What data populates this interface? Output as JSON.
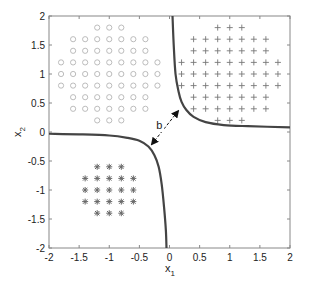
{
  "chart_data": {
    "type": "scatter",
    "title": "",
    "xlabel": "x",
    "xlabel_sub": "1",
    "ylabel": "x",
    "ylabel_sub": "2",
    "xlim": [
      -2,
      2
    ],
    "ylim": [
      -2,
      2
    ],
    "xticks": [
      -2,
      -1.5,
      -1,
      -0.5,
      0,
      0.5,
      1,
      1.5,
      2
    ],
    "yticks": [
      -2,
      -1.5,
      -1,
      -0.5,
      0,
      0.5,
      1,
      1.5,
      2
    ],
    "xtick_labels": [
      "-2",
      "-1.5",
      "-1",
      "-0.5",
      "0",
      "0.5",
      "1",
      "1.5",
      "2"
    ],
    "ytick_labels": [
      "-2",
      "-1.5",
      "-1",
      "-0.5",
      "0",
      "0.5",
      "1",
      "1.5",
      "2"
    ],
    "grid": false,
    "legend": null,
    "series": [
      {
        "name": "class-circle",
        "marker": "o",
        "color": "#b4b4b4",
        "center": [
          -1,
          1
        ],
        "rows": [
          {
            "y": 1.8,
            "x": [
              -1.2,
              -1.0,
              -0.8
            ]
          },
          {
            "y": 1.6,
            "x": [
              -1.6,
              -1.4,
              -1.2,
              -1.0,
              -0.8,
              -0.6,
              -0.4
            ]
          },
          {
            "y": 1.4,
            "x": [
              -1.6,
              -1.4,
              -1.2,
              -1.0,
              -0.8,
              -0.6,
              -0.4
            ]
          },
          {
            "y": 1.2,
            "x": [
              -1.8,
              -1.6,
              -1.4,
              -1.2,
              -1.0,
              -0.8,
              -0.6,
              -0.4,
              -0.2
            ]
          },
          {
            "y": 1.0,
            "x": [
              -1.8,
              -1.6,
              -1.4,
              -1.2,
              -1.0,
              -0.8,
              -0.6,
              -0.4,
              -0.2
            ]
          },
          {
            "y": 0.8,
            "x": [
              -1.8,
              -1.6,
              -1.4,
              -1.2,
              -1.0,
              -0.8,
              -0.6,
              -0.4,
              -0.2
            ]
          },
          {
            "y": 0.6,
            "x": [
              -1.6,
              -1.4,
              -1.2,
              -1.0,
              -0.8,
              -0.6,
              -0.4
            ]
          },
          {
            "y": 0.4,
            "x": [
              -1.6,
              -1.4,
              -1.2,
              -1.0,
              -0.8,
              -0.6,
              -0.4
            ]
          },
          {
            "y": 0.2,
            "x": [
              -1.2,
              -1.0,
              -0.8
            ]
          }
        ]
      },
      {
        "name": "class-plus",
        "marker": "+",
        "color": "#777777",
        "center": [
          1,
          1
        ],
        "rows": [
          {
            "y": 1.8,
            "x": [
              0.8,
              1.0,
              1.2
            ]
          },
          {
            "y": 1.6,
            "x": [
              0.4,
              0.6,
              0.8,
              1.0,
              1.2,
              1.4,
              1.6
            ]
          },
          {
            "y": 1.4,
            "x": [
              0.4,
              0.6,
              0.8,
              1.0,
              1.2,
              1.4,
              1.6
            ]
          },
          {
            "y": 1.2,
            "x": [
              0.2,
              0.4,
              0.6,
              0.8,
              1.0,
              1.2,
              1.4,
              1.6,
              1.8
            ]
          },
          {
            "y": 1.0,
            "x": [
              0.2,
              0.4,
              0.6,
              0.8,
              1.0,
              1.2,
              1.4,
              1.6,
              1.8
            ]
          },
          {
            "y": 0.8,
            "x": [
              0.2,
              0.4,
              0.6,
              0.8,
              1.0,
              1.2,
              1.4,
              1.6,
              1.8
            ]
          },
          {
            "y": 0.6,
            "x": [
              0.4,
              0.6,
              0.8,
              1.0,
              1.2,
              1.4,
              1.6
            ]
          },
          {
            "y": 0.4,
            "x": [
              0.4,
              0.6,
              0.8,
              1.0,
              1.2,
              1.4,
              1.6
            ]
          },
          {
            "y": 0.2,
            "x": [
              0.8,
              1.0,
              1.2
            ]
          }
        ]
      },
      {
        "name": "class-asterisk",
        "marker": "*",
        "color": "#666666",
        "center": [
          -1,
          -1
        ],
        "rows": [
          {
            "y": -0.6,
            "x": [
              -1.2,
              -1.0,
              -0.8
            ]
          },
          {
            "y": -0.8,
            "x": [
              -1.4,
              -1.2,
              -1.0,
              -0.8,
              -0.6
            ]
          },
          {
            "y": -1.0,
            "x": [
              -1.4,
              -1.2,
              -1.0,
              -0.8,
              -0.6
            ]
          },
          {
            "y": -1.2,
            "x": [
              -1.4,
              -1.2,
              -1.0,
              -0.8,
              -0.6
            ]
          },
          {
            "y": -1.4,
            "x": [
              -1.2,
              -1.0,
              -0.8
            ]
          }
        ]
      }
    ],
    "curves": [
      {
        "name": "boundary-upper-right",
        "color": "#444444",
        "points": [
          [
            0.05,
            2.0
          ],
          [
            0.07,
            1.5
          ],
          [
            0.1,
            1.0
          ],
          [
            0.15,
            0.7
          ],
          [
            0.2,
            0.52
          ],
          [
            0.28,
            0.38
          ],
          [
            0.4,
            0.26
          ],
          [
            0.6,
            0.17
          ],
          [
            0.9,
            0.12
          ],
          [
            1.3,
            0.1
          ],
          [
            2.0,
            0.08
          ]
        ]
      },
      {
        "name": "boundary-lower-left",
        "color": "#444444",
        "points": [
          [
            -2.0,
            -0.03
          ],
          [
            -1.5,
            -0.04
          ],
          [
            -1.0,
            -0.06
          ],
          [
            -0.7,
            -0.1
          ],
          [
            -0.5,
            -0.15
          ],
          [
            -0.35,
            -0.25
          ],
          [
            -0.25,
            -0.4
          ],
          [
            -0.18,
            -0.6
          ],
          [
            -0.13,
            -0.9
          ],
          [
            -0.09,
            -1.3
          ],
          [
            -0.06,
            -1.7
          ],
          [
            -0.05,
            -2.0
          ]
        ]
      }
    ],
    "annotations": [
      {
        "text": "b",
        "x": -0.17,
        "y": 0.12,
        "type": "double-arrow",
        "from": [
          -0.3,
          -0.22
        ],
        "to": [
          0.15,
          0.37
        ]
      }
    ]
  }
}
